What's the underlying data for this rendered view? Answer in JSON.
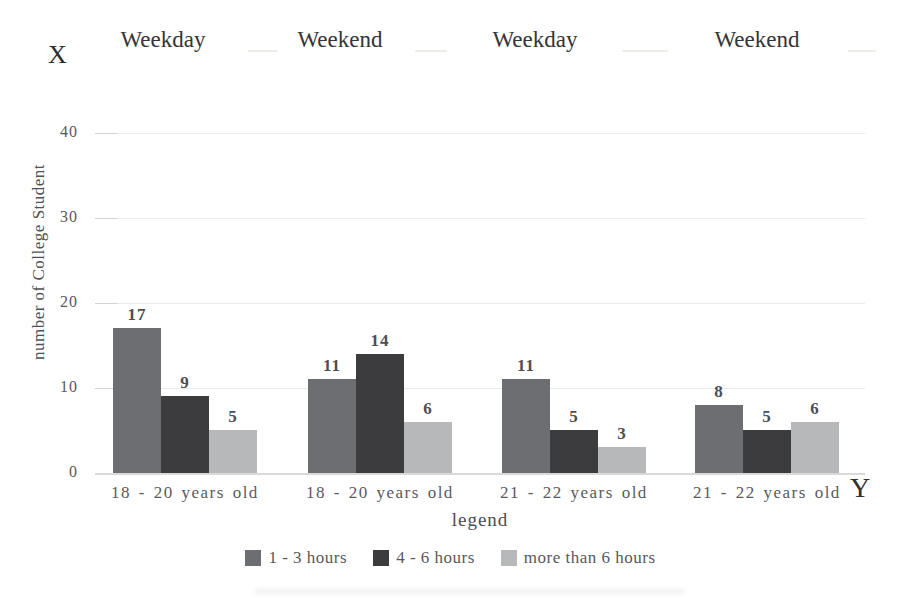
{
  "corner_labels": {
    "top_left": "X",
    "bottom_right": "Y"
  },
  "chart_data": {
    "type": "bar",
    "title": "",
    "top_axis_labels": [
      "Weekday",
      "Weekend",
      "Weekday",
      "Weekend"
    ],
    "categories": [
      "18 - 20 years old",
      "18 - 20 years old",
      "21 - 22 years old",
      "21 - 22 years old"
    ],
    "series": [
      {
        "name": "1 - 3 hours",
        "color": "#6d6e71",
        "values": [
          17,
          11,
          11,
          8
        ]
      },
      {
        "name": "4 - 6 hours",
        "color": "#3c3c3e",
        "values": [
          9,
          14,
          5,
          5
        ]
      },
      {
        "name": "more than 6 hours",
        "color": "#b7b8ba",
        "values": [
          5,
          6,
          3,
          6
        ]
      }
    ],
    "ylabel": "number of College Student",
    "xlabel": "",
    "yticks": [
      0,
      10,
      20,
      30,
      40
    ],
    "ylim": [
      0,
      40
    ],
    "grid": true,
    "bar_value_labels": true,
    "legend_title": "legend",
    "legend_position": "bottom"
  }
}
